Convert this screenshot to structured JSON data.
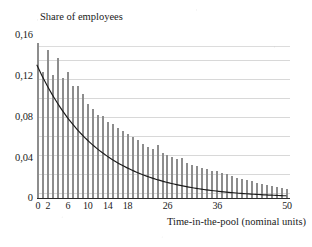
{
  "chart_data": {
    "type": "bar",
    "title": "",
    "xlabel": "Time-in-the-pool  (nominal units)",
    "ylabel": "Share of employees",
    "xlim": [
      0,
      50
    ],
    "ylim": [
      0,
      0.175
    ],
    "grid": true,
    "legend": null,
    "y_tick_labels": [
      "0,16",
      "0,12",
      "0,08",
      "0,04",
      "0"
    ],
    "y_tick_values": [
      0.16,
      0.12,
      0.08,
      0.04,
      0
    ],
    "y_gridline_values": [
      0.16,
      0.145,
      0.125,
      0.105,
      0.085,
      0.065,
      0.045,
      0.025,
      0.005
    ],
    "x_tick_labels": [
      "0",
      "2",
      "6",
      "10",
      "14",
      "18",
      "26",
      "36",
      "50"
    ],
    "x_tick_values": [
      0,
      2,
      6,
      10,
      14,
      18,
      26,
      36,
      50
    ],
    "categories": [
      0,
      1,
      2,
      3,
      4,
      5,
      6,
      7,
      8,
      9,
      10,
      11,
      12,
      13,
      14,
      15,
      16,
      17,
      18,
      19,
      20,
      21,
      22,
      23,
      24,
      25,
      26,
      27,
      28,
      29,
      30,
      31,
      32,
      33,
      34,
      35,
      36,
      37,
      38,
      39,
      40,
      41,
      42,
      43,
      44,
      45,
      46,
      47,
      48,
      49,
      50
    ],
    "values": [
      0.163,
      0.133,
      0.156,
      0.13,
      0.148,
      0.126,
      0.133,
      0.118,
      0.118,
      0.11,
      0.099,
      0.094,
      0.087,
      0.086,
      0.08,
      0.078,
      0.074,
      0.071,
      0.067,
      0.064,
      0.061,
      0.057,
      0.054,
      0.052,
      0.056,
      0.047,
      0.045,
      0.043,
      0.041,
      0.042,
      0.037,
      0.035,
      0.034,
      0.032,
      0.031,
      0.029,
      0.028,
      0.026,
      0.025,
      0.023,
      0.021,
      0.02,
      0.019,
      0.018,
      0.016,
      0.015,
      0.014,
      0.013,
      0.012,
      0.011,
      0.01
    ],
    "overlay_curve": {
      "name": "fitted exponential",
      "color": "#1a1a1a",
      "formula_note": "y = 0.140 * exp(-x/12.2)",
      "y0": 0.14,
      "decay_constant": 12.2,
      "points_x": [
        0,
        2,
        4,
        6,
        8,
        10,
        12,
        14,
        16,
        18,
        20,
        22,
        24,
        26,
        28,
        30,
        32,
        34,
        36,
        38,
        40,
        42,
        44,
        46,
        48,
        50
      ],
      "points_y": [
        0.14,
        0.119,
        0.101,
        0.085,
        0.072,
        0.061,
        0.052,
        0.044,
        0.037,
        0.032,
        0.027,
        0.023,
        0.019,
        0.016,
        0.014,
        0.012,
        0.01,
        0.0085,
        0.0072,
        0.0061,
        0.0052,
        0.0044,
        0.0037,
        0.0031,
        0.0027,
        0.0023
      ]
    },
    "bar_color": "#8d8d8d",
    "gridline_color": "#d8d8d8",
    "axis_color": "#2a2a2a"
  }
}
